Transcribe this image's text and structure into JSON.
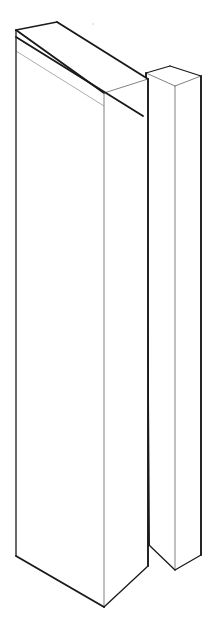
{
  "canvas": {
    "width": 217,
    "height": 636,
    "background_color": "#ffffff",
    "stroke_color": "#1a1a1a",
    "light_stroke_color": "#8a8a8a",
    "figure_description": "Line-art axonometric drawing of two parallel upright rectangular slabs separated by a narrow vertical gap"
  },
  "figure": {
    "title": "Two parallel slabs in axonometric view",
    "object_count": 2,
    "objects": [
      {
        "name": "front-slab",
        "label": "Front slab",
        "faces": [
          "front",
          "right-side",
          "top"
        ],
        "has_inner_board_line": true
      },
      {
        "name": "rear-slab",
        "label": "Rear slab",
        "faces": [
          "front",
          "right-side",
          "top"
        ],
        "has_inner_board_line": false
      }
    ]
  },
  "geometry": {
    "front_slab": {
      "top_face": "M16,30 L57,22 L148,79 L104,93 Z",
      "front_face": "M16,30 L16,556 L104,607 L104,93 Z",
      "right_face": "M104,93 L148,79 L148,566 L104,607 Z",
      "spine_line_a": "M16,37 L142,84",
      "spine_line_b": "M16,51 L140,97",
      "top_left_vertex": [
        16,
        30
      ],
      "top_back_vertex": [
        57,
        22
      ],
      "top_right_vertex": [
        148,
        79
      ],
      "top_front_vertex": [
        104,
        93
      ],
      "bottom_left_vertex": [
        16,
        556
      ],
      "bottom_front_vertex": [
        104,
        607
      ],
      "bottom_right_vertex": [
        148,
        566
      ]
    },
    "rear_slab": {
      "top_face": "M146,73 L170,66 L201,76 L175,86 Z",
      "front_face": "M146,73 L149,545 L175,570 L175,86 Z",
      "right_face": "M175,86 L201,76 L201,555 L175,570 Z",
      "top_left_vertex": [
        146,
        73
      ],
      "top_back_vertex": [
        170,
        66
      ],
      "top_right_vertex": [
        201,
        76
      ],
      "top_front_vertex": [
        175,
        86
      ],
      "bottom_left_vertex": [
        149,
        545
      ],
      "bottom_front_vertex": [
        175,
        570
      ],
      "bottom_right_vertex": [
        201,
        555
      ]
    },
    "gap": {
      "description": "Narrow vertical slot between the two slabs",
      "left_edge": "M148,79 L148,566",
      "right_edge": "M146,73 L149,545",
      "approx_width_px": 3
    },
    "speck": {
      "cx": 93,
      "cy": 24,
      "r": 1.2,
      "description": "small faint scanning artifact near top"
    }
  }
}
